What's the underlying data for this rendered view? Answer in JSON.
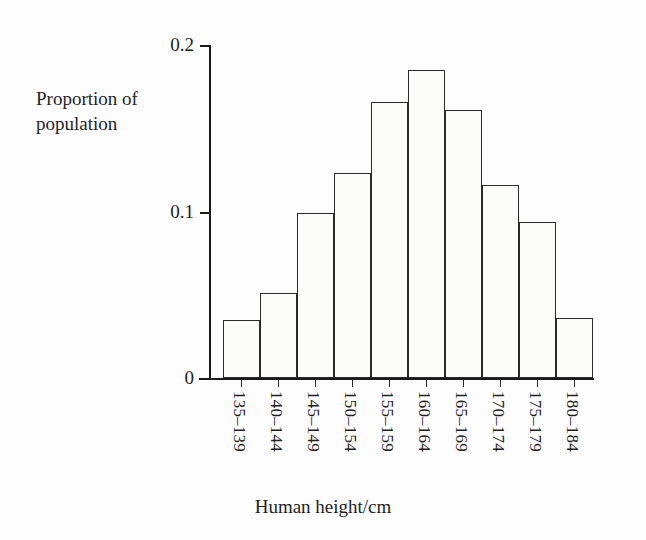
{
  "chart_data": {
    "type": "bar",
    "title": "",
    "xlabel": "Human height/cm",
    "ylabel": "Proportion of\npopulation",
    "categories": [
      "135–139",
      "140–144",
      "145–149",
      "150–154",
      "155–159",
      "160–164",
      "165–169",
      "170–174",
      "175–179",
      "180–184"
    ],
    "values": [
      0.035,
      0.051,
      0.099,
      0.123,
      0.166,
      0.185,
      0.161,
      0.116,
      0.094,
      0.036
    ],
    "ylim": [
      0,
      0.2
    ],
    "yticks": [
      0,
      0.1,
      0.2
    ],
    "ytick_labels": [
      "0",
      "0.1",
      "0.2"
    ],
    "grid": false,
    "legend": null,
    "bar_style": {
      "fill": "#fbfbfa",
      "edge": "#2a2a2a",
      "contiguous": true
    },
    "axis_color": "#1b1b1b",
    "background": "#fdfdfd"
  },
  "figure": {
    "y_axis_label": "Proportion of\npopulation",
    "x_axis_title": "Human height/cm"
  }
}
